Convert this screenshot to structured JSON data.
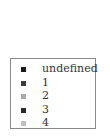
{
  "chart_data": {
    "type": "legend",
    "title": "",
    "legend": {
      "placement": "center",
      "entries": [
        {
          "label": "undefined",
          "color": "#1a1a1a"
        },
        {
          "label": "1",
          "color": "#3a3a3a"
        },
        {
          "label": "2",
          "color": "#a8a8a8"
        },
        {
          "label": "3",
          "color": "#2a2a2a"
        },
        {
          "label": "4",
          "color": "#c0c0c0"
        }
      ]
    }
  }
}
